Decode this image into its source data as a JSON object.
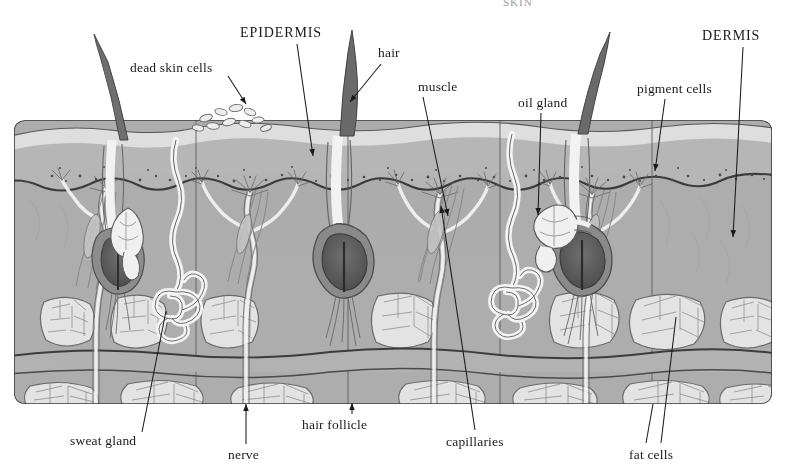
{
  "figure": {
    "kind": "anatomical-cross-section",
    "clipped_top_caption": "SKIN",
    "background_color": "#ffffff",
    "ink_color": "#1a1a1a"
  },
  "palette": {
    "stratum_corneum": "#dcdcdc",
    "epidermis": "#b4b4b4",
    "epidermis_shadow": "#9a9a9a",
    "dermis": "#adadad",
    "dermis_deep": "#a3a3a3",
    "fascia": "#b0b0b0",
    "fat_lobule": "#e2e2e2",
    "fat_outline": "#6f6f6f",
    "vessel_white": "#f4f4f4",
    "hair_dark": "#4a4a4a",
    "bulb_dark": "#5c5c5c",
    "outline": "#3a3a3a",
    "pigment_dot": "#4d4d4d"
  },
  "labels": [
    {
      "id": "dead-skin-cells",
      "text": "dead skin cells",
      "x": 130,
      "y": 60,
      "style": "lower",
      "leader": {
        "x1": 228,
        "y1": 76,
        "x2": 246,
        "y2": 104,
        "arrow": true
      }
    },
    {
      "id": "epidermis",
      "text": "EPIDERMIS",
      "x": 240,
      "y": 25,
      "style": "caps",
      "leader": {
        "x1": 297,
        "y1": 44,
        "x2": 313,
        "y2": 156,
        "arrow": true
      }
    },
    {
      "id": "hair",
      "text": "hair",
      "x": 378,
      "y": 45,
      "style": "lower",
      "leader": {
        "x1": 381,
        "y1": 64,
        "x2": 350,
        "y2": 102,
        "arrow": true
      }
    },
    {
      "id": "muscle",
      "text": "muscle",
      "x": 418,
      "y": 79,
      "style": "lower",
      "leader": {
        "x1": 423,
        "y1": 97,
        "x2": 448,
        "y2": 216,
        "arrow": true
      }
    },
    {
      "id": "oil-gland",
      "text": "oil gland",
      "x": 518,
      "y": 95,
      "style": "lower",
      "leader": {
        "x1": 541,
        "y1": 113,
        "x2": 538,
        "y2": 215,
        "arrow": true
      }
    },
    {
      "id": "pigment-cells",
      "text": "pigment cells",
      "x": 637,
      "y": 81,
      "style": "lower",
      "leader": {
        "x1": 665,
        "y1": 99,
        "x2": 655,
        "y2": 171,
        "arrow": true
      }
    },
    {
      "id": "dermis",
      "text": "DERMIS",
      "x": 702,
      "y": 28,
      "style": "caps",
      "leader": {
        "x1": 743,
        "y1": 47,
        "x2": 733,
        "y2": 237,
        "arrow": true
      }
    },
    {
      "id": "sweat-gland",
      "text": "sweat gland",
      "x": 70,
      "y": 433,
      "style": "lower",
      "leader": {
        "x1": 142,
        "y1": 432,
        "x2": 166,
        "y2": 311,
        "arrow": false
      }
    },
    {
      "id": "nerve",
      "text": "nerve",
      "x": 228,
      "y": 447,
      "style": "lower",
      "leader": {
        "x1": 246,
        "y1": 444,
        "x2": 246,
        "y2": 404,
        "arrow": true
      }
    },
    {
      "id": "hair-follicle",
      "text": "hair follicle",
      "x": 302,
      "y": 417,
      "style": "lower",
      "leader": {
        "x1": 352,
        "y1": 414,
        "x2": 352,
        "y2": 403,
        "arrow": true
      }
    },
    {
      "id": "capillaries",
      "text": "capillaries",
      "x": 446,
      "y": 434,
      "style": "lower",
      "leader": {
        "x1": 475,
        "y1": 430,
        "x2": 441,
        "y2": 206,
        "arrow": true
      }
    },
    {
      "id": "fat-cells",
      "text": "fat cells",
      "x": 629,
      "y": 447,
      "style": "lower",
      "leader": {
        "x1": 646,
        "y1": 443,
        "x2": 653,
        "y2": 404,
        "arrow": false
      },
      "leader2": {
        "x1": 661,
        "y1": 443,
        "x2": 676,
        "y2": 317,
        "arrow": false
      }
    }
  ],
  "structures": {
    "block": {
      "x": 14,
      "y": 117,
      "width": 758,
      "height": 288
    },
    "segments": 5,
    "hair_shafts": 3,
    "fat_lobule_rows": 2,
    "sweat_gland_coils": 2,
    "oil_glands": 2
  }
}
